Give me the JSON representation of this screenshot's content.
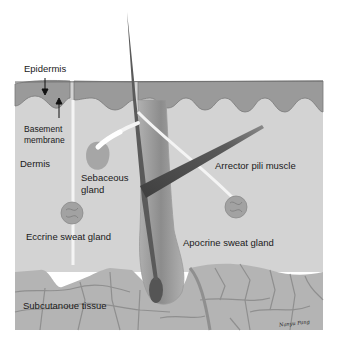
{
  "labels": {
    "epidermis": "Epidermis",
    "basement_membrane_line1": "Basement",
    "basement_membrane_line2": "membrane",
    "dermis": "Dermis",
    "sebaceous_line1": "Sebaceous",
    "sebaceous_line2": "gland",
    "arrector": "Arrector pili muscle",
    "eccrine": "Eccrine sweat gland",
    "apocrine": "Apocrine sweat gland",
    "subcutaneous": "Subcutanoue tissue"
  },
  "signature": "Nanyu Pang",
  "colors": {
    "epidermis": "#9a9a9a",
    "epidermis_edge": "#7a7a7a",
    "dermis": "#d3d3d3",
    "subcutaneous": "#b4b4b4",
    "fat_lines": "#8f8f8f",
    "hair": "#5a5a5a",
    "follicle": "#9e9e9e",
    "muscle": "#4e4e4e",
    "duct": "#f4f4f4",
    "gland": "#a2a2a2",
    "text": "#1a1a1a"
  }
}
